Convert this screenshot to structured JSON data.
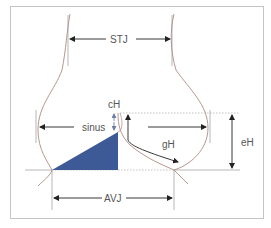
{
  "diagram": {
    "type": "aortic root anatomy schematic",
    "labels": {
      "stj": "STJ",
      "sinus": "sinus",
      "ch": "cH",
      "gh": "gH",
      "eh": "eH",
      "avj": "AVJ"
    },
    "colors": {
      "frame": "#bdbdbd",
      "wall": "#b08a84",
      "guide": "#9a9a9a",
      "arrow": "#222222",
      "cusp": "#3e5a96",
      "ch_arrow": "#6d7fa8",
      "text": "#555555"
    }
  }
}
